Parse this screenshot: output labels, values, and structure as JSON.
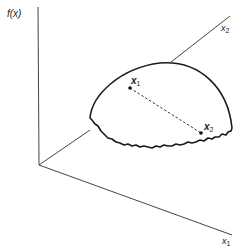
{
  "figure": {
    "vertical_axis_label": "f(x)",
    "axis_x1_label": "x",
    "axis_x1_subscript": "1",
    "axis_x2_label": "x",
    "axis_x2_subscript": "2",
    "point_1_label": "x",
    "point_1_subscript": "1",
    "point_2_label": "x",
    "point_2_subscript": "2"
  },
  "colors": {
    "stroke": "#222222",
    "background": "#ffffff"
  }
}
